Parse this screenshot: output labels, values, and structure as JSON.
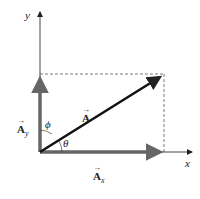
{
  "diagram": {
    "axes": {
      "x_label": "x",
      "y_label": "y"
    },
    "vector": {
      "label": "A",
      "arrow": "→"
    },
    "components": {
      "x": {
        "label": "A",
        "sub": "x",
        "arrow": "→"
      },
      "y": {
        "label": "A",
        "sub": "y",
        "arrow": "→"
      }
    },
    "angles": {
      "theta": "θ",
      "phi": "ϕ"
    },
    "colors": {
      "axis": "#444444",
      "component": "#666666",
      "vector": "#111111",
      "dashed": "#555555"
    }
  }
}
